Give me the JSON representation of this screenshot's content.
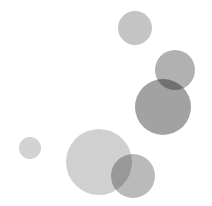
{
  "canvas": {
    "width": 212,
    "height": 206,
    "background": "#ffffff"
  },
  "circles": [
    {
      "name": "circle-top",
      "cx": 135,
      "cy": 28,
      "r": 17,
      "color": "#b4b4b4",
      "opacity": 0.78
    },
    {
      "name": "circle-upper-right",
      "cx": 175,
      "cy": 70,
      "r": 20,
      "color": "#9e9e9e",
      "opacity": 0.8
    },
    {
      "name": "circle-large-right",
      "cx": 163,
      "cy": 107,
      "r": 28,
      "color": "#8e8e8e",
      "opacity": 0.82
    },
    {
      "name": "circle-small-left",
      "cx": 30,
      "cy": 148,
      "r": 11,
      "color": "#c4c4c4",
      "opacity": 0.75
    },
    {
      "name": "circle-large-bottom",
      "cx": 99,
      "cy": 162,
      "r": 33,
      "color": "#c0c0c0",
      "opacity": 0.75
    },
    {
      "name": "circle-small-bottom",
      "cx": 133,
      "cy": 176,
      "r": 22,
      "color": "#a6a6a6",
      "opacity": 0.78
    }
  ]
}
